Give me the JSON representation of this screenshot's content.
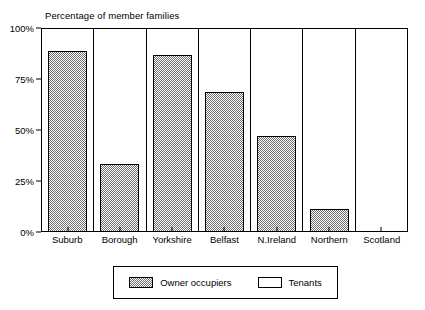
{
  "chart_data": {
    "type": "bar",
    "title": "Percentage of member families",
    "subtitle": "",
    "xlabel": "",
    "ylabel": "",
    "stacked": true,
    "stacked_total": 100,
    "grid": false,
    "legend_position": "bottom",
    "ylim": [
      0,
      100
    ],
    "y_ticks": [
      "0%",
      "25%",
      "50%",
      "75%",
      "100%"
    ],
    "y_tick_values": [
      0,
      25,
      50,
      75,
      100
    ],
    "categories": [
      "Suburb",
      "Borough",
      "Yorkshire",
      "Belfast",
      "N.Ireland",
      "Northern",
      "Scotland"
    ],
    "series": [
      {
        "name": "Owner occupiers",
        "fill": "hatched-gray",
        "color": "#a8a8a8",
        "values": [
          89,
          33,
          87,
          69,
          47,
          11,
          0
        ]
      },
      {
        "name": "Tenants",
        "fill": "white",
        "color": "#ffffff",
        "values": [
          11,
          67,
          13,
          31,
          53,
          89,
          100
        ]
      }
    ]
  },
  "legend": {
    "entries": [
      {
        "label": "Owner occupiers",
        "swatch": "owner"
      },
      {
        "label": "Tenants",
        "swatch": "tenants"
      }
    ]
  },
  "colors": {
    "axis": "#000000",
    "background": "#ffffff",
    "owner_fill": "#a8a8a8",
    "tenants_fill": "#ffffff"
  }
}
